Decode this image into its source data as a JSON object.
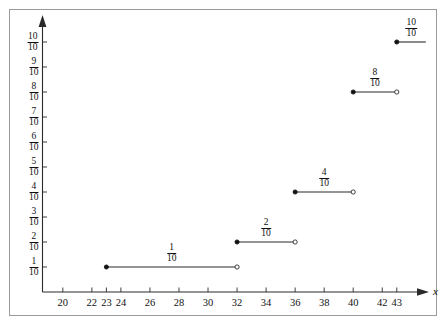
{
  "chart_data": {
    "type": "line",
    "subtype": "step-function-empirical-cdf",
    "title": "",
    "subtitle": "",
    "xlabel": "x",
    "ylabel": "",
    "xlim": [
      18.6,
      44.6
    ],
    "ylim": [
      0,
      1.08
    ],
    "grid": false,
    "legend": null,
    "x_ticks": [
      {
        "value": 20,
        "label": "20"
      },
      {
        "value": 22,
        "label": "22"
      },
      {
        "value": 23,
        "label": "23"
      },
      {
        "value": 24,
        "label": "24"
      },
      {
        "value": 26,
        "label": "26"
      },
      {
        "value": 28,
        "label": "28"
      },
      {
        "value": 30,
        "label": "30"
      },
      {
        "value": 32,
        "label": "32"
      },
      {
        "value": 34,
        "label": "34"
      },
      {
        "value": 36,
        "label": "36"
      },
      {
        "value": 38,
        "label": "38"
      },
      {
        "value": 40,
        "label": "40"
      },
      {
        "value": 42,
        "label": "42"
      },
      {
        "value": 43,
        "label": "43"
      }
    ],
    "y_ticks": [
      {
        "value": 0.1,
        "num": "1",
        "den": "10"
      },
      {
        "value": 0.2,
        "num": "2",
        "den": "10"
      },
      {
        "value": 0.3,
        "num": "3",
        "den": "10"
      },
      {
        "value": 0.4,
        "num": "4",
        "den": "10"
      },
      {
        "value": 0.5,
        "num": "5",
        "den": "10"
      },
      {
        "value": 0.6,
        "num": "6",
        "den": "10"
      },
      {
        "value": 0.7,
        "num": "7",
        "den": "10"
      },
      {
        "value": 0.8,
        "num": "8",
        "den": "10"
      },
      {
        "value": 0.9,
        "num": "9",
        "den": "10"
      },
      {
        "value": 1.0,
        "num": "10",
        "den": "10"
      }
    ],
    "steps": [
      {
        "x_start": 23,
        "x_end": 32,
        "y": 0.1,
        "num": "1",
        "den": "10",
        "label_x": 27.5,
        "closed_left": true,
        "open_right": true
      },
      {
        "x_start": 32,
        "x_end": 36,
        "y": 0.2,
        "num": "2",
        "den": "10",
        "label_x": 34.0,
        "closed_left": true,
        "open_right": true
      },
      {
        "x_start": 36,
        "x_end": 40,
        "y": 0.4,
        "num": "4",
        "den": "10",
        "label_x": 38.0,
        "closed_left": true,
        "open_right": true
      },
      {
        "x_start": 40,
        "x_end": 43,
        "y": 0.8,
        "num": "8",
        "den": "10",
        "label_x": 41.5,
        "closed_left": true,
        "open_right": true
      },
      {
        "x_start": 43,
        "x_end": 45,
        "y": 1.0,
        "num": "10",
        "den": "10",
        "label_x": 44.0,
        "closed_left": true,
        "open_right": false
      }
    ],
    "series": [
      {
        "name": "cumulative relative frequency",
        "x": [
          23,
          32,
          36,
          40,
          43
        ],
        "values": [
          0.1,
          0.2,
          0.4,
          0.8,
          1.0
        ]
      }
    ],
    "colors": {
      "axis": "#2a2a2a",
      "step": "#2a2a2a",
      "marker_filled": "#111111",
      "marker_open": "#ffffff",
      "frame": "#9a9a9a",
      "background": "#ffffff"
    }
  },
  "axes": {
    "x_axis_name": "x"
  }
}
